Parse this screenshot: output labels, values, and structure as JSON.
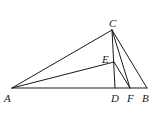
{
  "diagram": {
    "type": "geometry",
    "points": {
      "A": {
        "label": "A",
        "x": 12,
        "y": 88,
        "lx": 4,
        "ly": 102
      },
      "B": {
        "label": "B",
        "x": 147,
        "y": 88,
        "lx": 142,
        "ly": 102
      },
      "C": {
        "label": "C",
        "x": 112,
        "y": 30,
        "lx": 109,
        "ly": 27
      },
      "D": {
        "label": "D",
        "x": 115,
        "y": 88,
        "lx": 111,
        "ly": 102
      },
      "E": {
        "label": "E",
        "x": 114,
        "y": 62,
        "lx": 102,
        "ly": 63
      },
      "F": {
        "label": "F",
        "x": 130,
        "y": 88,
        "lx": 127,
        "ly": 102
      }
    },
    "segments": [
      [
        "A",
        "B"
      ],
      [
        "A",
        "C"
      ],
      [
        "C",
        "B"
      ],
      [
        "C",
        "D"
      ],
      [
        "C",
        "F"
      ],
      [
        "A",
        "E"
      ],
      [
        "E",
        "F"
      ]
    ],
    "stroke_color": "#1a1a1a"
  }
}
